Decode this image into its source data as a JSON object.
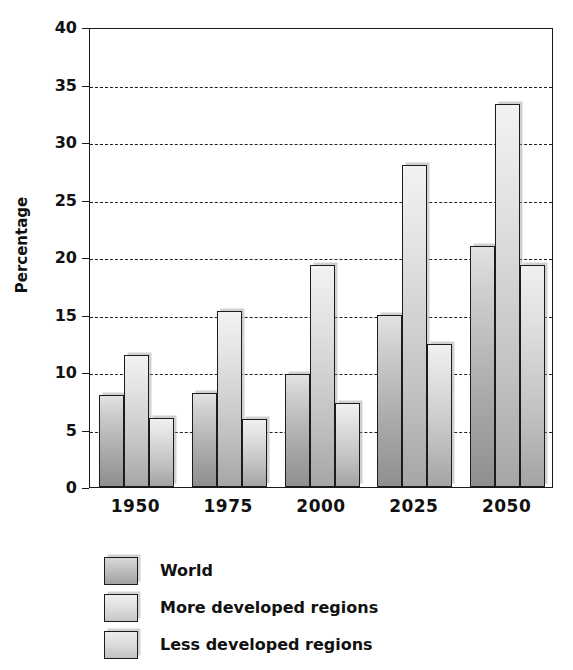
{
  "chart_data": {
    "type": "bar",
    "title": "",
    "subtitle": "",
    "xlabel": "",
    "ylabel": "Percentage",
    "categories": [
      "1950",
      "1975",
      "2000",
      "2025",
      "2050"
    ],
    "series": [
      {
        "name": "World",
        "values": [
          8.0,
          8.2,
          9.8,
          15.0,
          21.0
        ],
        "color": "#b4b4b4"
      },
      {
        "name": "More developed regions",
        "values": [
          11.5,
          15.3,
          19.3,
          28.0,
          33.3
        ],
        "color": "#dcdcdc"
      },
      {
        "name": "Less developed regions",
        "values": [
          6.0,
          5.9,
          7.3,
          12.4,
          19.3
        ],
        "color": "#d8d8d8"
      }
    ],
    "ylim": [
      0,
      40
    ],
    "yticks": [
      0,
      5,
      10,
      15,
      20,
      25,
      30,
      35,
      40
    ],
    "ytick_labels": [
      "0",
      "5",
      "10",
      "15",
      "20",
      "25",
      "30",
      "35",
      "40"
    ],
    "grid": "horizontal-dashed",
    "legend_position": "bottom-left",
    "frame": "box"
  }
}
